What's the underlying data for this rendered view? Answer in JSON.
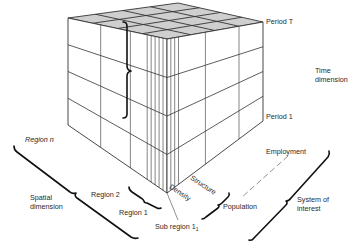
{
  "diagram": {
    "colors": {
      "line": "#333333",
      "top_face": "#cfcfcf",
      "background": "#ffffff",
      "text": "#2a2a2a"
    },
    "cube": {
      "vertices": {
        "top_back": [
          178,
          3
        ],
        "top_left": [
          68,
          18
        ],
        "top_right": [
          263,
          22
        ],
        "top_front": [
          167,
          39
        ],
        "bottom_left": [
          68,
          125
        ],
        "bottom_right": [
          263,
          121
        ],
        "bottom_front": [
          167,
          193
        ]
      },
      "time_layers": 4,
      "left_face_columns": [
        0.0,
        0.33,
        0.63,
        0.8,
        0.84,
        0.88,
        0.92,
        0.96,
        1.0
      ],
      "right_face_columns": [
        0.0,
        0.04,
        0.08,
        0.12,
        0.4,
        0.75,
        1.0
      ],
      "top_face_rows": 4,
      "top_face_cols": 4
    },
    "time_axis": {
      "top_label": "Period T",
      "bottom_label": "Period 1",
      "dimension_label_line1": "Time",
      "dimension_label_line2": "dimension"
    },
    "spatial_axis": {
      "region_n": "Region n",
      "region_2": "Region 2",
      "region_1": "Region 1",
      "subregion_prefix": "Sub region 1",
      "subregion_subscript": "1",
      "dimension_label_line1": "Spatial",
      "dimension_label_line2": "dimension"
    },
    "system_axis": {
      "structure": "Structure",
      "density": "Density",
      "population": "Population",
      "employment": "Employment",
      "dimension_label_line1": "System of",
      "dimension_label_line2": "interest"
    }
  }
}
